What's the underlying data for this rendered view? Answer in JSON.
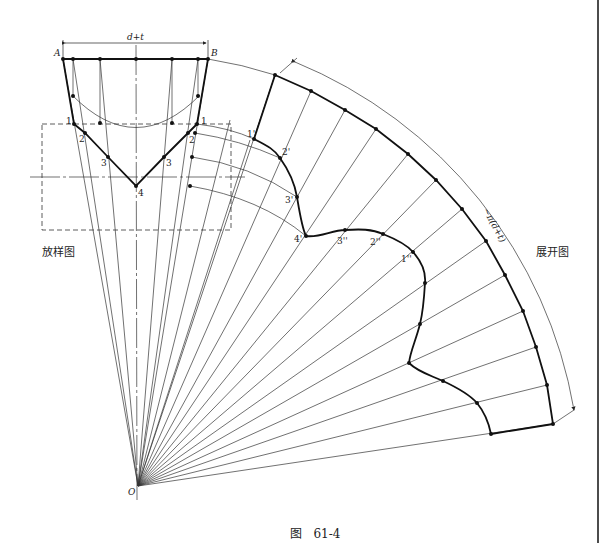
{
  "figure": {
    "caption_prefix": "图",
    "caption_number": "61-4",
    "layout_label": "放样图",
    "development_label": "展开图"
  },
  "annotations": {
    "dim_top": "d+t",
    "dim_arc": "~π(d+t)",
    "point_A": "A",
    "point_B": "B",
    "apex": "O",
    "section_points": [
      "1",
      "2",
      "3",
      "4"
    ],
    "curve_points_single": [
      "1'",
      "2'",
      "3'",
      "4'"
    ],
    "curve_points_double": [
      "3''",
      "2''",
      "1''"
    ]
  },
  "geometry": {
    "apex": [
      138,
      486
    ],
    "outer_radius": 432,
    "sector_start_deg": 18.4,
    "sector_end_deg": 81.5,
    "segments": 13,
    "line_color": "#222222"
  }
}
